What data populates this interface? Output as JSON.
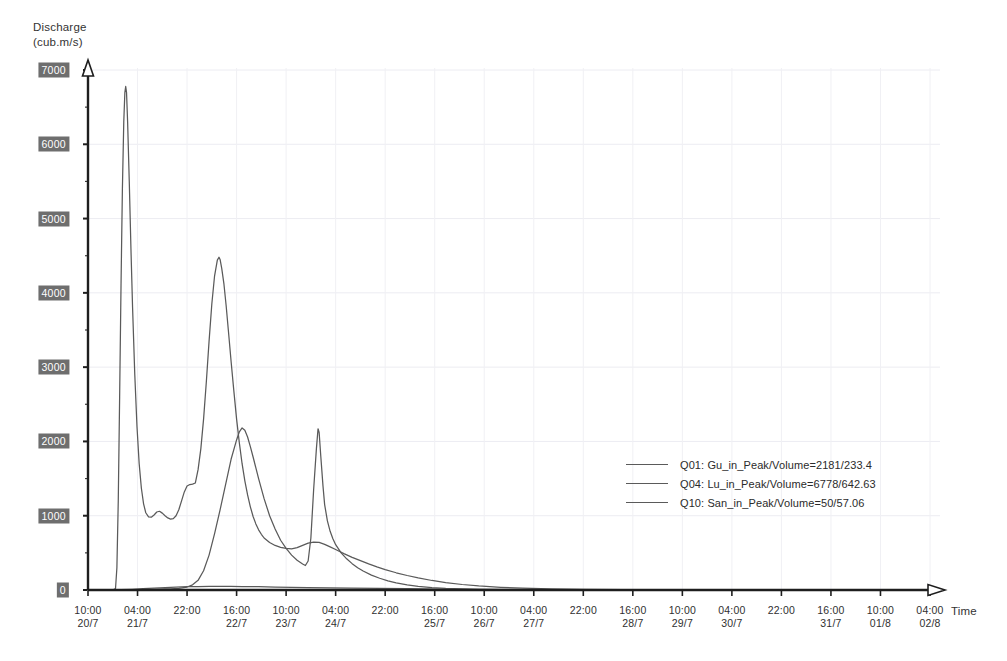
{
  "chart_data": {
    "type": "line",
    "title": "",
    "ylabel": "Discharge\n(cub.m/s)",
    "ylabel_line1": "Discharge",
    "ylabel_line2": "(cub.m/s)",
    "xlabel": "Time",
    "ylim": [
      0,
      7000
    ],
    "ytick_values": [
      0,
      1000,
      2000,
      3000,
      4000,
      5000,
      6000,
      7000
    ],
    "ytick_labels": [
      "0",
      "1000",
      "2000",
      "3000",
      "4000",
      "5000",
      "6000",
      "7000"
    ],
    "grid": "faint",
    "legend_position": "center-right",
    "xtick_labels": [
      {
        "time": "10:00",
        "date": "20/7"
      },
      {
        "time": "04:00",
        "date": "21/7"
      },
      {
        "time": "22:00",
        "date": ""
      },
      {
        "time": "16:00",
        "date": "22/7"
      },
      {
        "time": "10:00",
        "date": "23/7"
      },
      {
        "time": "04:00",
        "date": "24/7"
      },
      {
        "time": "22:00",
        "date": ""
      },
      {
        "time": "16:00",
        "date": "25/7"
      },
      {
        "time": "10:00",
        "date": "26/7"
      },
      {
        "time": "04:00",
        "date": "27/7"
      },
      {
        "time": "22:00",
        "date": ""
      },
      {
        "time": "16:00",
        "date": "28/7"
      },
      {
        "time": "10:00",
        "date": "29/7"
      },
      {
        "time": "04:00",
        "date": "30/7"
      },
      {
        "time": "22:00",
        "date": ""
      },
      {
        "time": "16:00",
        "date": "31/7"
      },
      {
        "time": "10:00",
        "date": "01/8"
      },
      {
        "time": "04:00",
        "date": "02/8"
      }
    ],
    "x_start_hours": 10,
    "x_tick_interval_hours": 18,
    "x_total_hours": 306,
    "series": [
      {
        "name": "Q01",
        "label": "Q01: Gu_in_Peak/Volume=2181/233.4",
        "station": "Gu_in",
        "peak": 2181,
        "volume": 233.4,
        "color": "#5a5a5a",
        "points": [
          [
            0,
            0
          ],
          [
            10,
            0
          ],
          [
            16,
            2
          ],
          [
            20,
            6
          ],
          [
            24,
            10
          ],
          [
            28,
            14
          ],
          [
            30,
            16
          ],
          [
            33,
            22
          ],
          [
            36,
            40
          ],
          [
            38,
            70
          ],
          [
            40,
            130
          ],
          [
            42,
            260
          ],
          [
            44,
            470
          ],
          [
            46,
            760
          ],
          [
            48,
            1080
          ],
          [
            50,
            1420
          ],
          [
            52,
            1760
          ],
          [
            54,
            2020
          ],
          [
            55,
            2130
          ],
          [
            56,
            2181
          ],
          [
            57,
            2150
          ],
          [
            58,
            2060
          ],
          [
            59,
            1930
          ],
          [
            60,
            1790
          ],
          [
            62,
            1500
          ],
          [
            64,
            1230
          ],
          [
            66,
            1000
          ],
          [
            68,
            820
          ],
          [
            70,
            670
          ],
          [
            72,
            560
          ],
          [
            74,
            470
          ],
          [
            76,
            400
          ],
          [
            78,
            350
          ],
          [
            79,
            330
          ],
          [
            80,
            390
          ],
          [
            81,
            700
          ],
          [
            82,
            1350
          ],
          [
            83,
            1900
          ],
          [
            83.6,
            2170
          ],
          [
            84,
            2120
          ],
          [
            84.6,
            1800
          ],
          [
            85.4,
            1400
          ],
          [
            86,
            1150
          ],
          [
            87,
            930
          ],
          [
            88,
            790
          ],
          [
            89,
            690
          ],
          [
            90,
            610
          ],
          [
            92,
            500
          ],
          [
            94,
            420
          ],
          [
            96,
            355
          ],
          [
            98,
            300
          ],
          [
            100,
            255
          ],
          [
            103,
            200
          ],
          [
            106,
            158
          ],
          [
            109,
            124
          ],
          [
            112,
            97
          ],
          [
            116,
            70
          ],
          [
            120,
            50
          ],
          [
            125,
            33
          ],
          [
            130,
            22
          ],
          [
            136,
            14
          ],
          [
            142,
            9
          ],
          [
            150,
            5
          ],
          [
            160,
            3
          ],
          [
            175,
            1
          ],
          [
            200,
            0
          ],
          [
            250,
            0
          ],
          [
            306,
            0
          ]
        ]
      },
      {
        "name": "Q04",
        "label": "Q04: Lu_in_Peak/Volume=6778/642.63",
        "station": "Lu_in",
        "peak": 6778,
        "volume": 642.63,
        "color": "#5a5a5a",
        "points": [
          [
            0,
            0
          ],
          [
            9,
            0
          ],
          [
            10,
            20
          ],
          [
            10.5,
            300
          ],
          [
            11,
            1200
          ],
          [
            11.5,
            2600
          ],
          [
            12,
            4100
          ],
          [
            12.5,
            5400
          ],
          [
            13,
            6300
          ],
          [
            13.4,
            6700
          ],
          [
            13.7,
            6778
          ],
          [
            14,
            6700
          ],
          [
            14.4,
            6300
          ],
          [
            15,
            5500
          ],
          [
            15.6,
            4600
          ],
          [
            16.2,
            3800
          ],
          [
            17,
            2900
          ],
          [
            17.8,
            2200
          ],
          [
            18.6,
            1700
          ],
          [
            19.4,
            1370
          ],
          [
            20.2,
            1160
          ],
          [
            21,
            1040
          ],
          [
            22,
            985
          ],
          [
            23,
            980
          ],
          [
            24,
            1010
          ],
          [
            25,
            1050
          ],
          [
            26,
            1060
          ],
          [
            27,
            1035
          ],
          [
            28,
            1000
          ],
          [
            29,
            970
          ],
          [
            30,
            955
          ],
          [
            31,
            960
          ],
          [
            32,
            1000
          ],
          [
            33,
            1080
          ],
          [
            34,
            1200
          ],
          [
            35,
            1320
          ],
          [
            36,
            1400
          ],
          [
            37,
            1420
          ],
          [
            38,
            1425
          ],
          [
            39,
            1440
          ],
          [
            40,
            1620
          ],
          [
            41,
            1900
          ],
          [
            42,
            2300
          ],
          [
            43,
            2800
          ],
          [
            44,
            3350
          ],
          [
            45,
            3850
          ],
          [
            46,
            4230
          ],
          [
            47,
            4440
          ],
          [
            47.6,
            4480
          ],
          [
            48,
            4450
          ],
          [
            48.6,
            4330
          ],
          [
            49.4,
            4120
          ],
          [
            50.2,
            3830
          ],
          [
            51,
            3500
          ],
          [
            52,
            3080
          ],
          [
            53,
            2680
          ],
          [
            54,
            2300
          ],
          [
            55,
            1980
          ],
          [
            56,
            1700
          ],
          [
            57,
            1470
          ],
          [
            58,
            1280
          ],
          [
            59,
            1120
          ],
          [
            60,
            990
          ],
          [
            61,
            890
          ],
          [
            62,
            810
          ],
          [
            63,
            750
          ],
          [
            64,
            700
          ],
          [
            66,
            640
          ],
          [
            68,
            600
          ],
          [
            70,
            575
          ],
          [
            72,
            560
          ],
          [
            74,
            555
          ],
          [
            76,
            570
          ],
          [
            78,
            600
          ],
          [
            80,
            630
          ],
          [
            82,
            645
          ],
          [
            84,
            640
          ],
          [
            86,
            615
          ],
          [
            88,
            580
          ],
          [
            90,
            545
          ],
          [
            93,
            490
          ],
          [
            96,
            440
          ],
          [
            99,
            395
          ],
          [
            102,
            352
          ],
          [
            105,
            312
          ],
          [
            108,
            275
          ],
          [
            112,
            232
          ],
          [
            116,
            195
          ],
          [
            120,
            163
          ],
          [
            125,
            128
          ],
          [
            130,
            100
          ],
          [
            136,
            74
          ],
          [
            142,
            54
          ],
          [
            150,
            36
          ],
          [
            158,
            24
          ],
          [
            168,
            14
          ],
          [
            180,
            8
          ],
          [
            195,
            4
          ],
          [
            215,
            1
          ],
          [
            240,
            0
          ],
          [
            306,
            0
          ]
        ]
      },
      {
        "name": "Q10",
        "label": "Q10: San_in_Peak/Volume=50/57.06",
        "station": "San_in",
        "peak": 50,
        "volume": 57.06,
        "color": "#5a5a5a",
        "points": [
          [
            0,
            0
          ],
          [
            8,
            1
          ],
          [
            12,
            4
          ],
          [
            16,
            10
          ],
          [
            20,
            18
          ],
          [
            24,
            26
          ],
          [
            28,
            33
          ],
          [
            32,
            39
          ],
          [
            36,
            44
          ],
          [
            40,
            47
          ],
          [
            44,
            49
          ],
          [
            48,
            50
          ],
          [
            52,
            49
          ],
          [
            56,
            47
          ],
          [
            62,
            44
          ],
          [
            68,
            40
          ],
          [
            74,
            36
          ],
          [
            80,
            33
          ],
          [
            88,
            29
          ],
          [
            96,
            25
          ],
          [
            106,
            21
          ],
          [
            116,
            17
          ],
          [
            128,
            13
          ],
          [
            140,
            10
          ],
          [
            155,
            7
          ],
          [
            170,
            5
          ],
          [
            190,
            3
          ],
          [
            215,
            2
          ],
          [
            245,
            1
          ],
          [
            280,
            0
          ],
          [
            306,
            0
          ]
        ]
      }
    ]
  }
}
